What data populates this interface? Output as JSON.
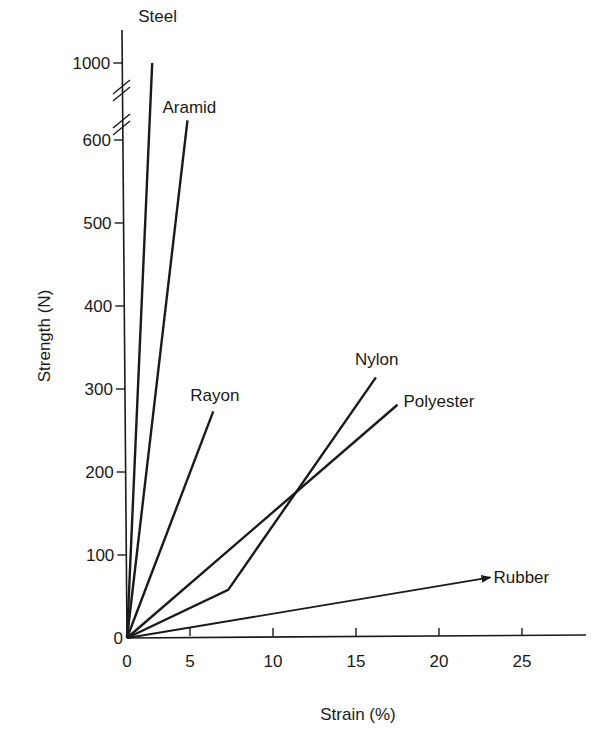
{
  "chart_data": {
    "type": "line",
    "title": "",
    "xlabel": "Strain (%)",
    "ylabel": "Strength (N)",
    "xlim": [
      0,
      29
    ],
    "ylim": [
      0,
      1050
    ],
    "y_axis_break": [
      600,
      1000
    ],
    "grid": false,
    "legend": "none (direct labels at line ends)",
    "x_ticks": [
      0,
      5,
      10,
      15,
      20,
      25
    ],
    "x_tick_labels": [
      "0",
      "5",
      "10",
      "15",
      "20",
      "25"
    ],
    "y_ticks": [
      0,
      100,
      200,
      300,
      400,
      500,
      600,
      1000
    ],
    "y_tick_labels": [
      "0",
      "100",
      "200",
      "300",
      "400",
      "500",
      "600",
      "1000"
    ],
    "series": [
      {
        "name": "Steel",
        "points": [
          [
            0,
            0
          ],
          [
            2.0,
            1000
          ]
        ]
      },
      {
        "name": "Aramid",
        "points": [
          [
            0,
            0
          ],
          [
            4.8,
            720
          ]
        ]
      },
      {
        "name": "Rayon",
        "points": [
          [
            0,
            0
          ],
          [
            6.4,
            273
          ]
        ]
      },
      {
        "name": "Nylon",
        "points": [
          [
            0,
            0
          ],
          [
            7.3,
            58
          ],
          [
            16.2,
            314
          ]
        ]
      },
      {
        "name": "Polyester",
        "points": [
          [
            0,
            0
          ],
          [
            17.5,
            281
          ]
        ]
      },
      {
        "name": "Rubber",
        "points": [
          [
            0,
            0
          ],
          [
            23.1,
            73
          ]
        ],
        "arrow": true
      }
    ]
  }
}
